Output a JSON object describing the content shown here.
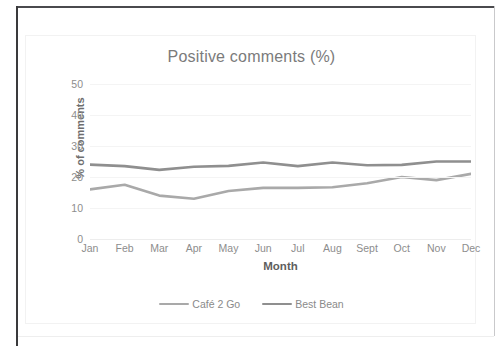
{
  "chart_data": {
    "type": "line",
    "title": "Positive comments (%)",
    "xlabel": "Month",
    "ylabel": "% of comments",
    "categories": [
      "Jan",
      "Feb",
      "Mar",
      "Apr",
      "May",
      "Jun",
      "Jul",
      "Aug",
      "Sept",
      "Oct",
      "Nov",
      "Dec"
    ],
    "series": [
      {
        "name": "Café 2 Go",
        "color": "#a9a9a9",
        "values": [
          16,
          17.5,
          14,
          13,
          15.5,
          16.5,
          16.5,
          16.7,
          18,
          20,
          19,
          21
        ]
      },
      {
        "name": "Best Bean",
        "color": "#8f8f8f",
        "values": [
          24,
          23.5,
          22.3,
          23.3,
          23.6,
          24.7,
          23.5,
          24.7,
          23.8,
          23.9,
          25,
          25
        ]
      }
    ],
    "ylim": [
      0,
      50
    ],
    "yticks": [
      0,
      10,
      20,
      30,
      40,
      50
    ],
    "ytick_labels": [
      "0",
      "10",
      "20",
      "30",
      "40",
      "50"
    ],
    "grid": true,
    "legend_position": "bottom"
  },
  "legend": {
    "items": [
      {
        "label": "Café 2 Go",
        "swatch": "line-swatch-cafe-2-go"
      },
      {
        "label": "Best Bean",
        "swatch": "line-swatch-best-bean"
      }
    ]
  }
}
